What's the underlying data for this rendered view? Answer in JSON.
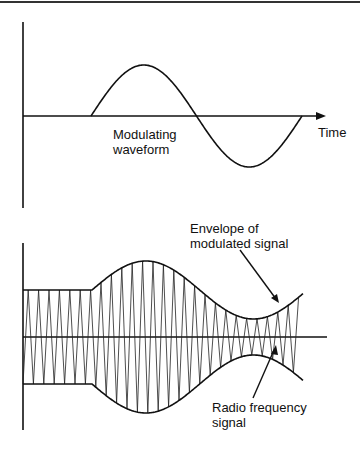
{
  "top_diagram": {
    "curve_label_line1": "Modulating",
    "curve_label_line2": "waveform",
    "axis_label": "Time"
  },
  "bottom_diagram": {
    "envelope_label_line1": "Envelope of",
    "envelope_label_line2": "modulated signal",
    "rf_label_line1": "Radio frequency",
    "rf_label_line2": "signal"
  },
  "colors": {
    "line": "#111111",
    "background": "#ffffff"
  }
}
